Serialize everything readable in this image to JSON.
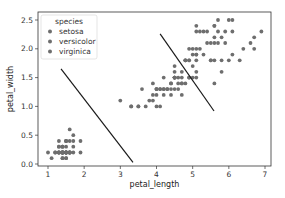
{
  "chart_data": {
    "type": "scatter",
    "title": "",
    "xlabel": "petal_length",
    "ylabel": "petal_width",
    "xlim": [
      0.7,
      7.2
    ],
    "ylim": [
      -0.05,
      2.6
    ],
    "xticks": [
      1,
      2,
      3,
      4,
      5,
      6,
      7
    ],
    "yticks": [
      0.0,
      0.5,
      1.0,
      1.5,
      2.0,
      2.5
    ],
    "ytick_labels": [
      "0.0",
      "0.5",
      "1.0",
      "1.5",
      "2.0",
      "2.5"
    ],
    "grid": false,
    "legend": {
      "title": "species",
      "position": "upper left",
      "entries": [
        "setosa",
        "versicolor",
        "virginica"
      ]
    },
    "marker_color": "#6e6e6e",
    "series": [
      {
        "name": "setosa",
        "points": [
          [
            1.4,
            0.2
          ],
          [
            1.4,
            0.2
          ],
          [
            1.3,
            0.2
          ],
          [
            1.5,
            0.2
          ],
          [
            1.4,
            0.2
          ],
          [
            1.7,
            0.4
          ],
          [
            1.4,
            0.3
          ],
          [
            1.5,
            0.2
          ],
          [
            1.4,
            0.2
          ],
          [
            1.5,
            0.1
          ],
          [
            1.5,
            0.2
          ],
          [
            1.6,
            0.2
          ],
          [
            1.4,
            0.1
          ],
          [
            1.1,
            0.1
          ],
          [
            1.2,
            0.2
          ],
          [
            1.5,
            0.4
          ],
          [
            1.3,
            0.4
          ],
          [
            1.4,
            0.3
          ],
          [
            1.7,
            0.3
          ],
          [
            1.5,
            0.3
          ],
          [
            1.7,
            0.2
          ],
          [
            1.5,
            0.4
          ],
          [
            1.0,
            0.2
          ],
          [
            1.7,
            0.5
          ],
          [
            1.9,
            0.2
          ],
          [
            1.6,
            0.2
          ],
          [
            1.6,
            0.4
          ],
          [
            1.5,
            0.2
          ],
          [
            1.4,
            0.2
          ],
          [
            1.6,
            0.2
          ],
          [
            1.6,
            0.2
          ],
          [
            1.5,
            0.4
          ],
          [
            1.5,
            0.1
          ],
          [
            1.4,
            0.2
          ],
          [
            1.5,
            0.2
          ],
          [
            1.2,
            0.2
          ],
          [
            1.3,
            0.2
          ],
          [
            1.4,
            0.1
          ],
          [
            1.3,
            0.2
          ],
          [
            1.5,
            0.2
          ],
          [
            1.3,
            0.3
          ],
          [
            1.3,
            0.3
          ],
          [
            1.3,
            0.2
          ],
          [
            1.6,
            0.6
          ],
          [
            1.9,
            0.4
          ],
          [
            1.4,
            0.3
          ],
          [
            1.6,
            0.2
          ],
          [
            1.4,
            0.2
          ],
          [
            1.5,
            0.2
          ],
          [
            1.4,
            0.2
          ]
        ]
      },
      {
        "name": "versicolor",
        "points": [
          [
            4.7,
            1.4
          ],
          [
            4.5,
            1.5
          ],
          [
            4.9,
            1.5
          ],
          [
            4.0,
            1.3
          ],
          [
            4.6,
            1.5
          ],
          [
            4.5,
            1.3
          ],
          [
            4.7,
            1.6
          ],
          [
            3.3,
            1.0
          ],
          [
            4.6,
            1.3
          ],
          [
            3.9,
            1.4
          ],
          [
            3.5,
            1.0
          ],
          [
            4.2,
            1.5
          ],
          [
            4.0,
            1.0
          ],
          [
            4.7,
            1.4
          ],
          [
            3.6,
            1.3
          ],
          [
            4.4,
            1.4
          ],
          [
            4.5,
            1.5
          ],
          [
            4.1,
            1.0
          ],
          [
            4.5,
            1.5
          ],
          [
            3.9,
            1.1
          ],
          [
            4.8,
            1.8
          ],
          [
            4.0,
            1.3
          ],
          [
            4.9,
            1.5
          ],
          [
            4.7,
            1.2
          ],
          [
            4.3,
            1.3
          ],
          [
            4.4,
            1.4
          ],
          [
            4.8,
            1.4
          ],
          [
            5.0,
            1.7
          ],
          [
            4.5,
            1.5
          ],
          [
            3.5,
            1.0
          ],
          [
            3.8,
            1.1
          ],
          [
            3.7,
            1.0
          ],
          [
            3.9,
            1.2
          ],
          [
            5.1,
            1.6
          ],
          [
            4.5,
            1.5
          ],
          [
            4.5,
            1.6
          ],
          [
            4.7,
            1.5
          ],
          [
            4.4,
            1.3
          ],
          [
            4.1,
            1.3
          ],
          [
            4.0,
            1.3
          ],
          [
            4.4,
            1.2
          ],
          [
            4.6,
            1.4
          ],
          [
            4.0,
            1.2
          ],
          [
            3.3,
            1.0
          ],
          [
            4.2,
            1.3
          ],
          [
            4.2,
            1.2
          ],
          [
            4.2,
            1.3
          ],
          [
            4.3,
            1.3
          ],
          [
            3.0,
            1.1
          ],
          [
            4.1,
            1.3
          ]
        ]
      },
      {
        "name": "virginica",
        "points": [
          [
            6.0,
            2.5
          ],
          [
            5.1,
            1.9
          ],
          [
            5.9,
            2.1
          ],
          [
            5.6,
            1.8
          ],
          [
            5.8,
            2.2
          ],
          [
            6.6,
            2.1
          ],
          [
            4.5,
            1.7
          ],
          [
            6.3,
            1.8
          ],
          [
            5.8,
            1.8
          ],
          [
            6.1,
            2.5
          ],
          [
            5.1,
            2.0
          ],
          [
            5.3,
            1.9
          ],
          [
            5.5,
            2.1
          ],
          [
            5.0,
            2.0
          ],
          [
            5.1,
            2.4
          ],
          [
            5.3,
            2.3
          ],
          [
            5.5,
            1.8
          ],
          [
            6.7,
            2.2
          ],
          [
            6.9,
            2.3
          ],
          [
            5.0,
            1.5
          ],
          [
            5.7,
            2.3
          ],
          [
            4.9,
            2.0
          ],
          [
            6.7,
            2.0
          ],
          [
            4.9,
            1.8
          ],
          [
            5.7,
            2.1
          ],
          [
            6.0,
            1.8
          ],
          [
            4.8,
            1.8
          ],
          [
            4.9,
            1.8
          ],
          [
            5.6,
            2.1
          ],
          [
            5.8,
            1.6
          ],
          [
            6.1,
            1.9
          ],
          [
            6.4,
            2.0
          ],
          [
            5.6,
            2.2
          ],
          [
            5.1,
            1.5
          ],
          [
            5.6,
            1.4
          ],
          [
            6.1,
            2.3
          ],
          [
            5.6,
            2.4
          ],
          [
            5.5,
            1.8
          ],
          [
            4.8,
            1.8
          ],
          [
            5.4,
            2.1
          ],
          [
            5.6,
            2.4
          ],
          [
            5.1,
            2.3
          ],
          [
            5.1,
            1.9
          ],
          [
            5.9,
            2.3
          ],
          [
            5.7,
            2.5
          ],
          [
            5.2,
            2.3
          ],
          [
            5.0,
            1.9
          ],
          [
            5.2,
            2.0
          ],
          [
            5.4,
            2.3
          ],
          [
            5.1,
            1.8
          ]
        ]
      }
    ],
    "decision_lines": [
      {
        "name": "boundary-setosa-versicolor",
        "x": [
          1.36,
          3.35
        ],
        "y": [
          1.65,
          0.03
        ],
        "color": "#1a1a1a"
      },
      {
        "name": "boundary-versicolor-virginica",
        "x": [
          4.1,
          5.59
        ],
        "y": [
          2.26,
          0.92
        ],
        "color": "#1a1a1a"
      }
    ]
  },
  "layout": {
    "plot_px": {
      "left": 38,
      "top": 12,
      "right": 271,
      "bottom": 166
    },
    "x_px": {
      "v0": 1,
      "p0": 48,
      "v1": 7,
      "p1": 265
    },
    "y_px": {
      "v0": 0,
      "p0": 164,
      "v1": 2.5,
      "p1": 20
    }
  }
}
